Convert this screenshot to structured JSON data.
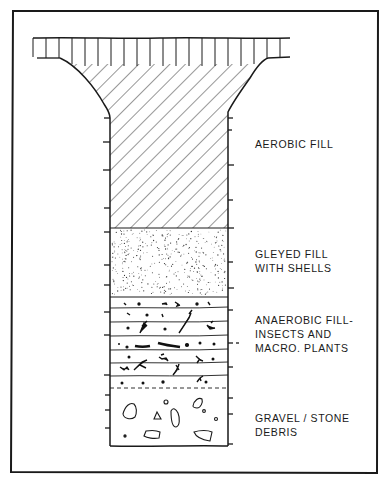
{
  "diagram": {
    "title": "",
    "type": "stratigraphic cross-section of a pit/well fill",
    "stroke_color": "#1a1a1a",
    "background": "#ffffff",
    "layers": [
      {
        "id": "aerobic",
        "pattern": "diagonal-hatch",
        "label_lines": [
          "AEROBIC  FILL"
        ]
      },
      {
        "id": "gleyed",
        "pattern": "stipple",
        "label_lines": [
          "GLEYED FILL",
          "WITH SHELLS"
        ]
      },
      {
        "id": "anaerobic",
        "pattern": "horizontal-bands-with-organic-fragments",
        "label_lines": [
          "ANAEROBIC  FILL-",
          "INSECTS AND",
          "MACRO.  PLANTS"
        ]
      },
      {
        "id": "gravel",
        "pattern": "scattered-stones",
        "label_lines": [
          "GRAVEL / STONE",
          "DEBRIS"
        ]
      }
    ],
    "cap_pattern": "vertical-hatch"
  }
}
